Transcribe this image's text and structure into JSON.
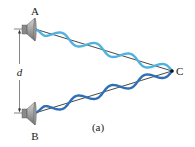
{
  "labels": {
    "source_a": "A",
    "source_b": "B",
    "point_c": "C",
    "separation": "d",
    "caption": "(a)"
  },
  "colors": {
    "wave_a": "#4fb3e0",
    "wave_b": "#2f6fb6",
    "line": "#1a1a1a",
    "speaker_body": "#a9a9a9",
    "speaker_dark": "#7a7a7a"
  },
  "geometry": {
    "source_a": [
      35,
      29
    ],
    "source_b": [
      35,
      113
    ],
    "point_c": [
      172,
      71
    ],
    "wave_cycles": 4
  }
}
